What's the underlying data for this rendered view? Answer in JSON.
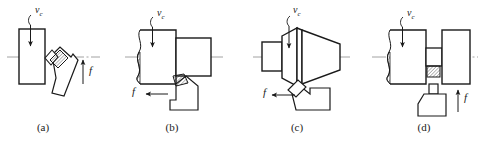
{
  "figure": {
    "type": "technical-diagram",
    "background_color": "#ffffff",
    "line_color": "#1a1a1a",
    "centerline_color": "#8a8a8a",
    "width": 484,
    "height": 145
  },
  "panels": [
    {
      "id": "a",
      "caption": "(a)",
      "caption_x": 43,
      "caption_y": 121,
      "operation": "facing",
      "velocity_label": "v",
      "velocity_subscript": "c",
      "velocity_label_x": 35,
      "velocity_label_y": 4,
      "feed_label": "f",
      "feed_label_x": 89,
      "feed_label_y": 70,
      "feed_direction": "up"
    },
    {
      "id": "b",
      "caption": "(b)",
      "caption_x": 172,
      "caption_y": 121,
      "operation": "cylindrical-turning",
      "velocity_label": "v",
      "velocity_subscript": "c",
      "velocity_label_x": 157,
      "velocity_label_y": 7,
      "feed_label": "f",
      "feed_label_x": 132,
      "feed_label_y": 90,
      "feed_direction": "left"
    },
    {
      "id": "c",
      "caption": "(c)",
      "caption_x": 297,
      "caption_y": 121,
      "operation": "taper-turning",
      "velocity_label": "v",
      "velocity_subscript": "c",
      "velocity_label_x": 293,
      "velocity_label_y": 4,
      "feed_label": "f",
      "feed_label_x": 263,
      "feed_label_y": 91,
      "feed_direction": "left"
    },
    {
      "id": "d",
      "caption": "(d)",
      "caption_x": 424,
      "caption_y": 121,
      "operation": "grooving-parting",
      "velocity_label": "v",
      "velocity_subscript": "c",
      "velocity_label_x": 407,
      "velocity_label_y": 7,
      "feed_label": "f",
      "feed_label_x": 464,
      "feed_label_y": 96,
      "feed_direction": "up"
    }
  ]
}
